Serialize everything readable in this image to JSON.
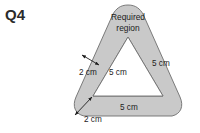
{
  "question": {
    "label": "Q4"
  },
  "figure": {
    "name": "rounded-triangle-annulus",
    "region_label_line1": "Required",
    "region_label_line2": "region",
    "colors": {
      "band_fill": "#c9c9c9",
      "inner_fill": "#ffffff",
      "outline": "#6e6e6e",
      "text": "#1c1c1c",
      "background": "#ffffff"
    },
    "inner_triangle": {
      "side_labels": [
        {
          "id": "left-side",
          "text": "5 cm"
        },
        {
          "id": "right-side",
          "text": "5 cm"
        },
        {
          "id": "bottom-side",
          "text": "5 cm"
        }
      ]
    },
    "band_width_labels": [
      {
        "id": "upper-left-offset",
        "text": "2 cm"
      },
      {
        "id": "lower-left-offset",
        "text": "2 cm"
      }
    ]
  }
}
